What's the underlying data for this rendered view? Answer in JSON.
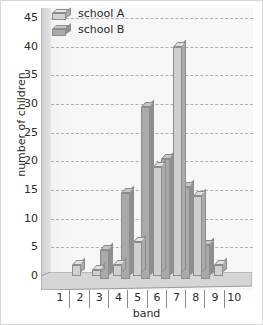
{
  "chart_data": {
    "type": "bar",
    "title": "",
    "xlabel": "band",
    "ylabel": "number of children",
    "categories": [
      "1",
      "2",
      "3",
      "4",
      "5",
      "6",
      "7",
      "8",
      "9",
      "10"
    ],
    "series": [
      {
        "name": "school A",
        "color": "#cfcfcf",
        "values": [
          0,
          2,
          1,
          2,
          6,
          19,
          40,
          14,
          2,
          0
        ]
      },
      {
        "name": "school B",
        "color": "#a9a9a9",
        "values": [
          0,
          0,
          5,
          15,
          30,
          21,
          16,
          6,
          0,
          0
        ]
      }
    ],
    "ylim": [
      0,
      45
    ],
    "ytick_step": 5,
    "yticks": [
      "45",
      "40",
      "35",
      "30",
      "25",
      "20",
      "15",
      "10",
      "5",
      "0"
    ],
    "grid": true,
    "legend_position": "top-left",
    "style": "3d-bars"
  },
  "legend": {
    "items": [
      {
        "label": "school A",
        "swatch": "bar-swatch-light"
      },
      {
        "label": "school B",
        "swatch": "bar-swatch-dark"
      }
    ]
  },
  "axes": {
    "y_title": "number of children",
    "x_title": "band"
  }
}
